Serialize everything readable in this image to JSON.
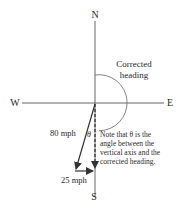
{
  "diagram": {
    "compass": {
      "north": "N",
      "south": "S",
      "east": "E",
      "west": "W"
    },
    "arc_label": [
      "Corrected",
      "heading"
    ],
    "vectors": {
      "airspeed": "80 mph",
      "wind": "25 mph"
    },
    "angle_symbol": "θ",
    "note": [
      "Note that θ is the",
      "angle between the",
      "vertical axis and the",
      "corrected heading."
    ],
    "colors": {
      "line": "#555555",
      "text": "#2a2a2a"
    }
  }
}
